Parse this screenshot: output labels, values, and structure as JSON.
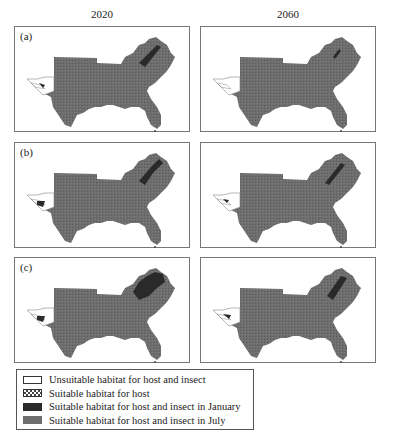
{
  "columns": [
    {
      "label": "2020"
    },
    {
      "label": "2060"
    }
  ],
  "rows": [
    {
      "label": "(a)",
      "panels": [
        {
          "year": "2020",
          "jan_extent": "narrow band"
        },
        {
          "year": "2060",
          "jan_extent": "small"
        }
      ]
    },
    {
      "label": "(b)",
      "panels": [
        {
          "year": "2020",
          "jan_extent": "medium band"
        },
        {
          "year": "2060",
          "jan_extent": "narrow band"
        }
      ]
    },
    {
      "label": "(c)",
      "panels": [
        {
          "year": "2020",
          "jan_extent": "large region"
        },
        {
          "year": "2060",
          "jan_extent": "narrow band"
        }
      ]
    }
  ],
  "legend": {
    "items": [
      {
        "label": "Unsuitable habitat for host and insect",
        "swatch": "white"
      },
      {
        "label": "Suitable habitat for host",
        "swatch": "checkered"
      },
      {
        "label": "Suitable habitat for host and insect in January",
        "swatch": "#2a2a2a"
      },
      {
        "label": "Suitable habitat for host and insect in July",
        "swatch": "#6e6e6e"
      }
    ]
  },
  "colors": {
    "july": "#6e6e6e",
    "january": "#2a2a2a",
    "unsuitable": "#ffffff",
    "border": "#777777"
  }
}
